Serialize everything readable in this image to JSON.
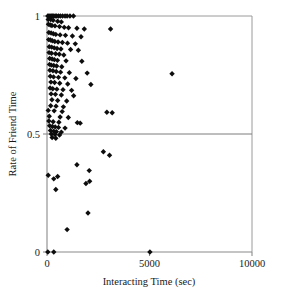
{
  "chart_data": {
    "type": "scatter",
    "title": "",
    "xlabel": "Interacting Time (sec)",
    "ylabel": "Rate of Friend Time",
    "xlim": [
      0,
      10000
    ],
    "ylim": [
      0,
      1
    ],
    "xticks": [
      0,
      5000,
      10000
    ],
    "xtick_labels": [
      "0",
      "5000",
      "10000"
    ],
    "yticks": [
      0,
      0.5,
      1
    ],
    "ytick_labels": [
      "0",
      "0.5",
      "1"
    ],
    "grid": false,
    "legend": "none",
    "marker": "diamond",
    "marker_color": "#0d0d0d",
    "reference_lines": [
      {
        "axis": "y",
        "value": 0.5,
        "color": "#7d7d7d"
      }
    ],
    "points": [
      [
        40,
        1.0
      ],
      [
        95,
        1.0
      ],
      [
        150,
        1.0
      ],
      [
        210,
        1.0
      ],
      [
        270,
        1.0
      ],
      [
        330,
        1.0
      ],
      [
        400,
        1.0
      ],
      [
        470,
        1.0
      ],
      [
        560,
        1.0
      ],
      [
        650,
        1.0
      ],
      [
        760,
        1.0
      ],
      [
        880,
        1.0
      ],
      [
        980,
        1.0
      ],
      [
        1120,
        1.0
      ],
      [
        1290,
        1.0
      ],
      [
        60,
        0.985
      ],
      [
        180,
        0.985
      ],
      [
        300,
        0.982
      ],
      [
        520,
        0.978
      ],
      [
        700,
        0.975
      ],
      [
        70,
        0.965
      ],
      [
        160,
        0.962
      ],
      [
        240,
        0.96
      ],
      [
        390,
        0.958
      ],
      [
        610,
        0.955
      ],
      [
        840,
        0.952
      ],
      [
        1050,
        0.95
      ],
      [
        1460,
        0.948
      ],
      [
        1820,
        0.945
      ],
      [
        3100,
        0.945
      ],
      [
        90,
        0.93
      ],
      [
        200,
        0.928
      ],
      [
        310,
        0.925
      ],
      [
        430,
        0.922
      ],
      [
        640,
        0.92
      ],
      [
        900,
        0.918
      ],
      [
        1240,
        0.915
      ],
      [
        1660,
        0.912
      ],
      [
        80,
        0.9
      ],
      [
        170,
        0.898
      ],
      [
        260,
        0.895
      ],
      [
        380,
        0.892
      ],
      [
        540,
        0.89
      ],
      [
        750,
        0.888
      ],
      [
        1000,
        0.885
      ],
      [
        1380,
        0.882
      ],
      [
        110,
        0.87
      ],
      [
        230,
        0.868
      ],
      [
        350,
        0.865
      ],
      [
        490,
        0.862
      ],
      [
        680,
        0.86
      ],
      [
        1150,
        0.858
      ],
      [
        1530,
        0.855
      ],
      [
        100,
        0.845
      ],
      [
        220,
        0.842
      ],
      [
        420,
        0.84
      ],
      [
        600,
        0.838
      ],
      [
        820,
        0.835
      ],
      [
        130,
        0.82
      ],
      [
        250,
        0.818
      ],
      [
        360,
        0.815
      ],
      [
        510,
        0.812
      ],
      [
        930,
        0.81
      ],
      [
        1700,
        0.808
      ],
      [
        120,
        0.795
      ],
      [
        210,
        0.792
      ],
      [
        330,
        0.79
      ],
      [
        470,
        0.788
      ],
      [
        720,
        0.785
      ],
      [
        140,
        0.77
      ],
      [
        290,
        0.768
      ],
      [
        450,
        0.765
      ],
      [
        660,
        0.762
      ],
      [
        1090,
        0.76
      ],
      [
        1960,
        0.758
      ],
      [
        6100,
        0.755
      ],
      [
        160,
        0.745
      ],
      [
        320,
        0.742
      ],
      [
        560,
        0.74
      ],
      [
        870,
        0.738
      ],
      [
        1410,
        0.735
      ],
      [
        190,
        0.72
      ],
      [
        370,
        0.718
      ],
      [
        620,
        0.715
      ],
      [
        1010,
        0.712
      ],
      [
        2140,
        0.71
      ],
      [
        150,
        0.695
      ],
      [
        280,
        0.692
      ],
      [
        480,
        0.69
      ],
      [
        780,
        0.688
      ],
      [
        1200,
        0.685
      ],
      [
        200,
        0.67
      ],
      [
        410,
        0.668
      ],
      [
        700,
        0.665
      ],
      [
        1300,
        0.662
      ],
      [
        240,
        0.645
      ],
      [
        520,
        0.642
      ],
      [
        960,
        0.64
      ],
      [
        180,
        0.62
      ],
      [
        440,
        0.618
      ],
      [
        800,
        0.615
      ],
      [
        60,
        0.6
      ],
      [
        350,
        0.598
      ],
      [
        740,
        0.595
      ],
      [
        2920,
        0.592
      ],
      [
        3180,
        0.59
      ],
      [
        110,
        0.575
      ],
      [
        640,
        0.572
      ],
      [
        1040,
        0.57
      ],
      [
        90,
        0.555
      ],
      [
        300,
        0.552
      ],
      [
        580,
        0.55
      ],
      [
        1480,
        0.548
      ],
      [
        1620,
        0.546
      ],
      [
        130,
        0.535
      ],
      [
        260,
        0.532
      ],
      [
        400,
        0.53
      ],
      [
        560,
        0.528
      ],
      [
        880,
        0.525
      ],
      [
        170,
        0.515
      ],
      [
        330,
        0.512
      ],
      [
        460,
        0.51
      ],
      [
        700,
        0.508
      ],
      [
        210,
        0.5
      ],
      [
        390,
        0.498
      ],
      [
        610,
        0.496
      ],
      [
        250,
        0.485
      ],
      [
        430,
        0.482
      ],
      [
        2750,
        0.425
      ],
      [
        3050,
        0.41
      ],
      [
        1460,
        0.37
      ],
      [
        2060,
        0.345
      ],
      [
        60,
        0.325
      ],
      [
        520,
        0.32
      ],
      [
        330,
        0.31
      ],
      [
        2080,
        0.3
      ],
      [
        1900,
        0.29
      ],
      [
        430,
        0.265
      ],
      [
        2000,
        0.165
      ],
      [
        980,
        0.095
      ],
      [
        40,
        0.0
      ],
      [
        330,
        0.0
      ],
      [
        5020,
        0.0
      ]
    ]
  }
}
